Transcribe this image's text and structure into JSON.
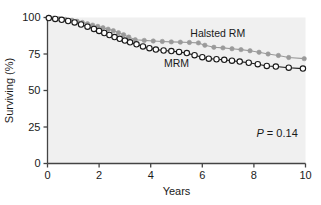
{
  "figure": {
    "background_color": "#ffffff",
    "plot_background_color": "#f0f0f0",
    "axis_color": "#444444"
  },
  "axes": {
    "x_title": "Years",
    "y_title": "Surviving (%)",
    "x_ticks": [
      "0",
      "2",
      "4",
      "6",
      "8",
      "10"
    ],
    "y_ticks": [
      "0",
      "25",
      "50",
      "75",
      "100"
    ]
  },
  "annotations": {
    "halsted_label": "Halsted RM",
    "mrm_label": "MRM",
    "pvalue_symbol": "P",
    "pvalue_text": " = 0.14"
  },
  "colors": {
    "halsted": "#9a9a9a",
    "mrm": "#1a1a1a",
    "marker_fill_open": "#ffffff",
    "plot_bg": "#f0f0f0"
  },
  "chart_data": {
    "type": "line",
    "title": "",
    "subtitle": "",
    "xlabel": "Years",
    "ylabel": "Surviving (%)",
    "xlim": [
      0,
      10
    ],
    "ylim": [
      0,
      100
    ],
    "xticks": [
      0,
      2,
      4,
      6,
      8,
      10
    ],
    "yticks": [
      0,
      25,
      50,
      75,
      100
    ],
    "grid": false,
    "legend": "inline-annotation",
    "annotations": [
      {
        "text": "Halsted RM",
        "x": 6.6,
        "y": 86.5
      },
      {
        "text": "MRM",
        "x": 5.0,
        "y": 66.0
      },
      {
        "text": "P = 0.14",
        "x": 8.9,
        "y": 18.0
      }
    ],
    "series": [
      {
        "name": "Halsted RM",
        "color": "#9a9a9a",
        "marker": "filled-circle",
        "points": [
          {
            "x": 0.05,
            "y": 100.0
          },
          {
            "x": 0.25,
            "y": 99.6
          },
          {
            "x": 0.45,
            "y": 99.2
          },
          {
            "x": 0.7,
            "y": 98.7
          },
          {
            "x": 0.95,
            "y": 98.1
          },
          {
            "x": 1.15,
            "y": 97.4
          },
          {
            "x": 1.35,
            "y": 96.6
          },
          {
            "x": 1.55,
            "y": 95.7
          },
          {
            "x": 1.75,
            "y": 94.8
          },
          {
            "x": 1.95,
            "y": 93.9
          },
          {
            "x": 2.15,
            "y": 93.0
          },
          {
            "x": 2.35,
            "y": 92.0
          },
          {
            "x": 2.55,
            "y": 91.0
          },
          {
            "x": 2.75,
            "y": 89.6
          },
          {
            "x": 2.95,
            "y": 88.2
          },
          {
            "x": 3.15,
            "y": 86.6
          },
          {
            "x": 3.4,
            "y": 84.8
          },
          {
            "x": 3.75,
            "y": 84.3
          },
          {
            "x": 4.1,
            "y": 83.9
          },
          {
            "x": 4.45,
            "y": 83.6
          },
          {
            "x": 4.8,
            "y": 83.3
          },
          {
            "x": 5.15,
            "y": 83.1
          },
          {
            "x": 5.5,
            "y": 82.9
          },
          {
            "x": 5.85,
            "y": 82.6
          },
          {
            "x": 6.1,
            "y": 81.0
          },
          {
            "x": 6.45,
            "y": 79.6
          },
          {
            "x": 6.8,
            "y": 79.2
          },
          {
            "x": 7.15,
            "y": 78.6
          },
          {
            "x": 7.5,
            "y": 78.0
          },
          {
            "x": 7.85,
            "y": 77.2
          },
          {
            "x": 8.2,
            "y": 76.2
          },
          {
            "x": 8.55,
            "y": 75.0
          },
          {
            "x": 8.95,
            "y": 74.0
          },
          {
            "x": 9.35,
            "y": 72.6
          },
          {
            "x": 9.95,
            "y": 71.8
          }
        ]
      },
      {
        "name": "MRM",
        "color": "#1a1a1a",
        "marker": "open-circle",
        "points": [
          {
            "x": 0.05,
            "y": 99.6
          },
          {
            "x": 0.3,
            "y": 99.0
          },
          {
            "x": 0.55,
            "y": 98.4
          },
          {
            "x": 0.8,
            "y": 97.6
          },
          {
            "x": 1.05,
            "y": 96.6
          },
          {
            "x": 1.3,
            "y": 95.2
          },
          {
            "x": 1.55,
            "y": 93.7
          },
          {
            "x": 1.8,
            "y": 92.2
          },
          {
            "x": 2.0,
            "y": 90.8
          },
          {
            "x": 2.2,
            "y": 89.4
          },
          {
            "x": 2.4,
            "y": 88.0
          },
          {
            "x": 2.6,
            "y": 86.6
          },
          {
            "x": 2.8,
            "y": 85.4
          },
          {
            "x": 3.0,
            "y": 84.2
          },
          {
            "x": 3.2,
            "y": 83.0
          },
          {
            "x": 3.45,
            "y": 81.6
          },
          {
            "x": 3.7,
            "y": 80.2
          },
          {
            "x": 3.95,
            "y": 79.0
          },
          {
            "x": 4.2,
            "y": 78.0
          },
          {
            "x": 4.5,
            "y": 77.4
          },
          {
            "x": 4.8,
            "y": 77.0
          },
          {
            "x": 5.1,
            "y": 76.4
          },
          {
            "x": 5.4,
            "y": 75.6
          },
          {
            "x": 5.7,
            "y": 74.2
          },
          {
            "x": 6.0,
            "y": 72.8
          },
          {
            "x": 6.25,
            "y": 71.8
          },
          {
            "x": 6.55,
            "y": 71.4
          },
          {
            "x": 6.85,
            "y": 71.0
          },
          {
            "x": 7.15,
            "y": 70.4
          },
          {
            "x": 7.45,
            "y": 69.8
          },
          {
            "x": 7.8,
            "y": 69.0
          },
          {
            "x": 8.15,
            "y": 68.0
          },
          {
            "x": 8.5,
            "y": 66.8
          },
          {
            "x": 8.85,
            "y": 66.4
          },
          {
            "x": 9.35,
            "y": 65.6
          },
          {
            "x": 9.9,
            "y": 65.0
          }
        ]
      }
    ]
  }
}
